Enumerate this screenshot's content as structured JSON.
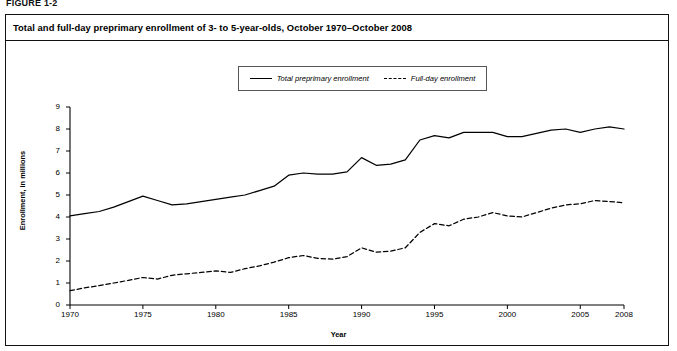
{
  "figure": {
    "label": "FIGURE 1-2",
    "title": "Total and full-day preprimary enrollment of 3- to 5-year-olds, October 1970–October 2008"
  },
  "legend": {
    "position": "top-center",
    "entries": [
      {
        "label": "Total preprimary enrollment",
        "style": "solid",
        "icon": "solid-line-swatch"
      },
      {
        "label": "Full-day enrollment",
        "style": "dashed",
        "icon": "dashed-line-swatch"
      }
    ]
  },
  "axes": {
    "y": {
      "label": "Enrollment, in millions",
      "ticks": [
        "0",
        "1",
        "2",
        "3",
        "4",
        "5",
        "6",
        "7",
        "8",
        "9"
      ]
    },
    "x": {
      "label": "Year",
      "ticks": [
        "1970",
        "1975",
        "1980",
        "1985",
        "1990",
        "1995",
        "2000",
        "2005",
        "2008"
      ]
    }
  },
  "chart_data": {
    "type": "line",
    "title": "Total and full-day preprimary enrollment of 3- to 5-year-olds, October 1970–October 2008",
    "xlabel": "Year",
    "ylabel": "Enrollment, in millions",
    "xlim": [
      1970,
      2008
    ],
    "ylim": [
      0,
      9
    ],
    "grid": false,
    "legend_position": "top-center",
    "x": [
      1970,
      1971,
      1972,
      1973,
      1974,
      1975,
      1976,
      1977,
      1978,
      1979,
      1980,
      1981,
      1982,
      1983,
      1984,
      1985,
      1986,
      1987,
      1988,
      1989,
      1990,
      1991,
      1992,
      1993,
      1994,
      1995,
      1996,
      1997,
      1998,
      1999,
      2000,
      2001,
      2002,
      2003,
      2004,
      2005,
      2006,
      2007,
      2008
    ],
    "series": [
      {
        "name": "Total preprimary enrollment",
        "style": "solid",
        "values": [
          4.05,
          4.15,
          4.25,
          4.45,
          4.7,
          4.95,
          4.75,
          4.55,
          4.6,
          4.7,
          4.8,
          4.9,
          5.0,
          5.2,
          5.4,
          5.9,
          6.0,
          5.95,
          5.95,
          6.05,
          6.7,
          6.35,
          6.4,
          6.6,
          7.5,
          7.7,
          7.6,
          7.85,
          7.85,
          7.85,
          7.65,
          7.65,
          7.8,
          7.95,
          8.0,
          7.85,
          8.0,
          8.1,
          8.0
        ]
      },
      {
        "name": "Full-day enrollment",
        "style": "dashed",
        "values": [
          0.65,
          0.78,
          0.88,
          1.0,
          1.12,
          1.25,
          1.18,
          1.35,
          1.42,
          1.48,
          1.55,
          1.48,
          1.65,
          1.78,
          1.95,
          2.15,
          2.25,
          2.12,
          2.08,
          2.2,
          2.6,
          2.4,
          2.45,
          2.6,
          3.3,
          3.7,
          3.6,
          3.9,
          4.0,
          4.2,
          4.05,
          4.0,
          4.2,
          4.4,
          4.55,
          4.6,
          4.75,
          4.7,
          4.65
        ]
      }
    ]
  }
}
